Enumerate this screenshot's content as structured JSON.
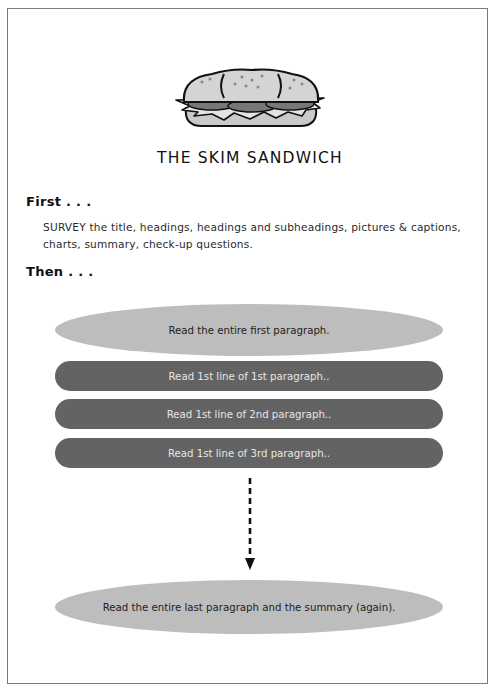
{
  "document": {
    "title": "THE SKIM SANDWICH",
    "illustration": "sandwich-icon",
    "sections": {
      "first_heading": "First . . .",
      "first_text": "SURVEY the title, headings, headings and subheadings, pictures & captions, charts, summary, check-up questions.",
      "then_heading": "Then . . ."
    },
    "steps": {
      "top_bun": "Read the entire first paragraph.",
      "fillings": [
        "Read 1st line of 1st paragraph..",
        "Read 1st line of 2nd paragraph..",
        "Read 1st line of 3rd paragraph.."
      ],
      "bottom_bun": "Read the entire last paragraph and the summary (again)."
    },
    "colors": {
      "bun": "#bdbdbd",
      "filling": "#636363",
      "border": "#7a7a7a"
    }
  }
}
